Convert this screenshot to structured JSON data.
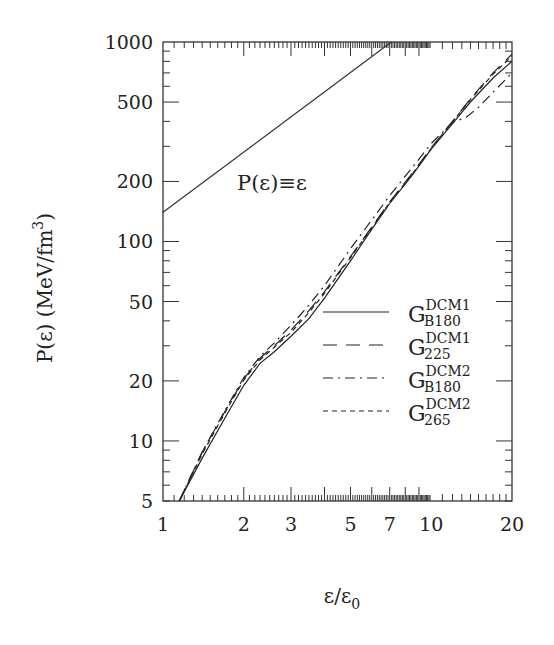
{
  "chart_data": {
    "type": "line",
    "title": "",
    "xlabel": "ε/ε₀",
    "ylabel": "P(ε)  (MeV/fm³)",
    "xscale": "log",
    "yscale": "log",
    "xlim": [
      1,
      20
    ],
    "ylim": [
      5,
      1000
    ],
    "xticks": [
      1,
      2,
      3,
      5,
      7,
      10,
      20
    ],
    "xtick_labels": [
      "1",
      "2",
      "3",
      "5",
      "7",
      "10",
      "20"
    ],
    "yticks": [
      5,
      10,
      20,
      50,
      100,
      200,
      500,
      1000
    ],
    "ytick_labels": [
      "5",
      "10",
      "20",
      "50",
      "100",
      "200",
      "500",
      "1000"
    ],
    "grid": false,
    "legend_position": "center-right",
    "annotation": {
      "text": "P(ε)≡ε",
      "line": {
        "x": [
          1,
          7.1
        ],
        "y": [
          140,
          1000
        ]
      }
    },
    "series": [
      {
        "name": "G_B180^DCM1",
        "label_main": "G",
        "label_sup": "DCM1",
        "label_sub": "B180",
        "style": "solid",
        "x": [
          1.15,
          1.4,
          1.7,
          2.0,
          2.3,
          2.6,
          3.0,
          3.5,
          4.0,
          5.0,
          6.0,
          7.0,
          8.5,
          10,
          12,
          14,
          17,
          20
        ],
        "y": [
          5,
          8.2,
          13,
          19,
          24.5,
          28,
          33.5,
          41,
          52,
          80,
          115,
          155,
          215,
          290,
          390,
          500,
          660,
          800
        ]
      },
      {
        "name": "G_225^DCM1",
        "label_main": "G",
        "label_sup": "DCM1",
        "label_sub": "225",
        "style": "dashed",
        "x": [
          1.15,
          1.4,
          1.7,
          2.0,
          2.3,
          2.6,
          3.0,
          3.5,
          4.0,
          5.0,
          6.0,
          7.0,
          8.5,
          10,
          12,
          14,
          17,
          20
        ],
        "y": [
          5,
          8.8,
          14,
          20.5,
          26,
          30,
          36,
          45,
          56,
          84,
          118,
          158,
          220,
          295,
          400,
          520,
          700,
          870
        ]
      },
      {
        "name": "G_B180^DCM2",
        "label_main": "G",
        "label_sup": "DCM2",
        "label_sub": "B180",
        "style": "dashdot",
        "x": [
          1.15,
          1.4,
          1.7,
          2.0,
          2.3,
          2.6,
          3.0,
          3.5,
          4.0,
          5.0,
          6.0,
          7.0,
          8.5,
          10,
          12,
          13.5,
          15,
          17,
          20
        ],
        "y": [
          5,
          8.8,
          14.2,
          20.8,
          26.5,
          31,
          38,
          48,
          60,
          92,
          128,
          170,
          235,
          310,
          395,
          420,
          470,
          560,
          700
        ]
      },
      {
        "name": "G_265^DCM2",
        "label_main": "G",
        "label_sup": "DCM2",
        "label_sub": "265",
        "style": "short-dashed",
        "x": [
          1.15,
          1.4,
          1.7,
          2.0,
          2.3,
          2.6,
          3.0,
          3.5,
          4.0,
          5.0,
          6.0,
          7.0,
          8.5,
          10,
          12,
          14,
          17,
          20
        ],
        "y": [
          5,
          8.6,
          13.8,
          20.2,
          25.5,
          29.5,
          35,
          44,
          55,
          83,
          117,
          157,
          218,
          293,
          398,
          515,
          690,
          850
        ]
      }
    ]
  }
}
